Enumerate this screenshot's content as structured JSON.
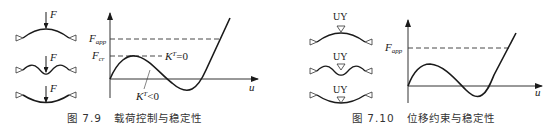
{
  "figures": [
    {
      "id": "fig-7-9",
      "caption_number": "图 7.9",
      "caption_text": "载荷控制与稳定性",
      "beam_label": "F",
      "beam_states": [
        "arched-up",
        "wavy",
        "arched-down"
      ],
      "axis_x_label": "u",
      "y_labels": {
        "f_app_main": "F",
        "f_app_sub": "app",
        "f_cr_main": "F",
        "f_cr_sub": "cr"
      },
      "annotations": {
        "kt_zero": "K",
        "kt_zero_sup": "T",
        "kt_zero_rel": "=0",
        "kt_neg": "K",
        "kt_neg_sup": "T",
        "kt_neg_rel": "<0"
      }
    },
    {
      "id": "fig-7-10",
      "caption_number": "图 7.10",
      "caption_text": "位移约束与稳定性",
      "beam_label": "UY",
      "beam_states": [
        "arched-up",
        "wavy",
        "arched-down"
      ],
      "axis_x_label": "u",
      "y_labels": {
        "f_app_main": "F",
        "f_app_sub": "app"
      }
    }
  ],
  "colors": {
    "line": "#1a1a1a",
    "axis": "#333333",
    "dash": "#333333",
    "caption": "#333333"
  }
}
